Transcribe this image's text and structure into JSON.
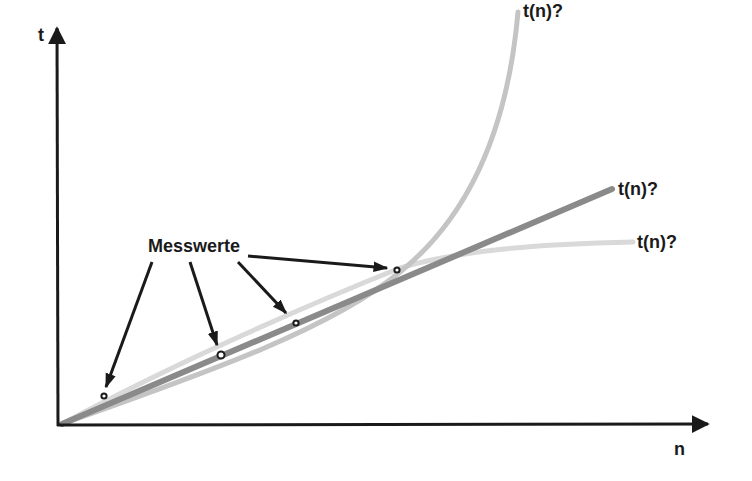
{
  "diagram": {
    "title": "",
    "axes": {
      "y_label": "t",
      "x_label": "n",
      "origin": [
        60,
        425
      ],
      "y_axis_tip": [
        57,
        28
      ],
      "x_axis_tip": [
        708,
        424
      ]
    },
    "curves": [
      {
        "id": "exponential",
        "label": "t(n)?",
        "color": "#c4c4c4",
        "width": 5,
        "path": "M 62 424 C 200 375, 330 330, 400 272 C 450 232, 505 160, 518 12",
        "label_pos": [
          523,
          2
        ]
      },
      {
        "id": "linear",
        "label": "t(n)?",
        "color": "#8a8a8a",
        "width": 6,
        "path": "M 62 424 L 612 189",
        "label_pos": [
          618,
          180
        ]
      },
      {
        "id": "logarithmic",
        "label": "t(n)?",
        "color": "#d9d9d9",
        "width": 5,
        "path": "M 62 424 C 180 360, 320 300, 400 268 C 460 250, 540 244, 633 242",
        "label_pos": [
          637,
          233
        ]
      }
    ],
    "measurements": {
      "label": "Messwerte",
      "label_pos": [
        148,
        237
      ],
      "points": [
        [
          104,
          396
        ],
        [
          221,
          355
        ],
        [
          296,
          323
        ],
        [
          397,
          270
        ]
      ],
      "arrows": [
        {
          "from": [
            152,
            262
          ],
          "to": [
            106,
            387
          ]
        },
        {
          "from": [
            190,
            262
          ],
          "to": [
            217,
            345
          ]
        },
        {
          "from": [
            238,
            262
          ],
          "to": [
            286,
            313
          ]
        },
        {
          "from": [
            248,
            256
          ],
          "to": [
            387,
            268
          ]
        }
      ],
      "point_color": "#1a1a1a"
    },
    "axis_color": "#1a1a1a"
  }
}
